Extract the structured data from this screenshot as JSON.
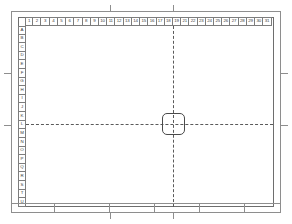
{
  "sheet": {
    "title": "engineering-drawing-sheet",
    "background_color": "#ffffff",
    "frame_color": "#8e8e8e",
    "inner_frame_color": "#6e6e6e",
    "ruler_border_color": "#7d7d7d",
    "ruler_text_color": "#3a3a3a",
    "centerline_color": "#5a5a5a",
    "part_outline_color": "#4a4a4a"
  },
  "ruler_top": {
    "name": "column-ruler",
    "labels": [
      "1",
      "2",
      "3",
      "4",
      "5",
      "6",
      "7",
      "8",
      "9",
      "10",
      "11",
      "12",
      "13",
      "14",
      "15",
      "16",
      "17",
      "18",
      "19",
      "21",
      "22",
      "23",
      "24",
      "25",
      "26",
      "27",
      "28",
      "29",
      "30",
      "31"
    ]
  },
  "ruler_left": {
    "name": "row-ruler",
    "labels": [
      "A",
      "B",
      "C",
      "D",
      "E",
      "F",
      "G",
      "H",
      "I",
      "J",
      "K",
      "L",
      "M",
      "N",
      "O",
      "P",
      "Q",
      "R",
      "S",
      "T",
      "U"
    ]
  },
  "centerlines": {
    "horizontal_label": "horizontal-centerline",
    "vertical_label": "vertical-centerline",
    "horizontal_y_pct": 54,
    "vertical_x_pct": 59.5
  },
  "part": {
    "name": "rounded-square-part",
    "shape": "rounded-square",
    "left_pct": 55,
    "top_pct": 48,
    "width_px": 23,
    "height_px": 22,
    "corner_radius_px": 5
  },
  "edge_ticks": {
    "top": [
      99,
      162
    ],
    "bottom": [
      99,
      162
    ],
    "left": [
      62,
      114
    ],
    "right": [
      62,
      114
    ]
  },
  "title_block": {
    "name": "title-block-strip",
    "segments": [
      "",
      "",
      "",
      "",
      "",
      ""
    ],
    "segment_widths": [
      44,
      55,
      45,
      45,
      45,
      36
    ]
  }
}
